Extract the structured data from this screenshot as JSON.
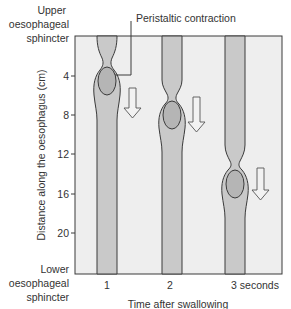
{
  "title_callout": "Peristaltic contraction",
  "upper_label": [
    "Upper",
    "oesophageal",
    "sphincter"
  ],
  "lower_label": [
    "Lower",
    "oesophageal",
    "sphincter"
  ],
  "y_axis": {
    "label": "Distance along the oesophagus (cm)",
    "ticks": [
      "4",
      "8",
      "12",
      "16",
      "20"
    ]
  },
  "x_axis": {
    "label": "Time after swallowing",
    "ticks": [
      "1",
      "2",
      "3 seconds"
    ]
  },
  "colors": {
    "background_panel": "#eeeeee",
    "tube_fill": "#c9c9c9",
    "bolus_fill": "#b5b5b5",
    "outline": "#3a3a3a",
    "arrow_fill": "#f2f2f2"
  },
  "panels": [
    {
      "time": "1",
      "contraction_cm": 5,
      "bolus_cm": 7.5,
      "arrow": "down-arrow"
    },
    {
      "time": "2",
      "contraction_cm": 8,
      "bolus_cm": 11,
      "arrow": "down-arrow"
    },
    {
      "time": "3 seconds",
      "contraction_cm": 13,
      "bolus_cm": 15,
      "arrow": "down-arrow"
    }
  ]
}
